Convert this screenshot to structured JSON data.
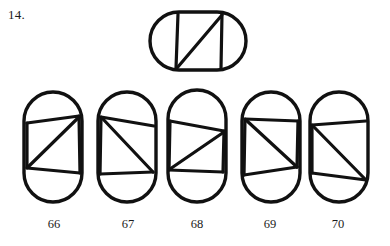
{
  "page": {
    "background_color": "#ffffff",
    "ink_color": "#111111",
    "item_number": "14."
  },
  "prompt": {
    "name": "target-figure",
    "orientation": "horizontal",
    "shape": "stadium",
    "description": "Horizontal stadium containing two vertical chords and one diagonal chord rising left-to-right"
  },
  "options": [
    {
      "label": "66",
      "orientation": "vertical",
      "shape": "stadium",
      "description": "Vertical stadium with upper chord, lower chord, right vertical chord, short left vertical chord and a diagonal falling from upper right to lower left"
    },
    {
      "label": "67",
      "orientation": "vertical",
      "shape": "stadium",
      "description": "Vertical stadium with upper chord, lower chord, left vertical chord and a diagonal falling from upper left to lower right"
    },
    {
      "label": "68",
      "orientation": "vertical",
      "shape": "stadium",
      "description": "Vertical stadium with upper chord, lower chord, both left and right vertical chords and a diagonal falling from upper right to lower left"
    },
    {
      "label": "69",
      "orientation": "vertical",
      "shape": "stadium",
      "description": "Vertical stadium with upper chord, lower chord, left vertical chord, right vertical chord and a diagonal falling from upper left to lower right"
    },
    {
      "label": "70",
      "orientation": "vertical",
      "shape": "stadium",
      "description": "Vertical stadium with upper chord, lower chord, left vertical chord and a diagonal falling from upper left to lower right meeting the lower right corner"
    }
  ],
  "chart_data": {
    "type": "diagram",
    "figures": [
      {
        "id": "prompt",
        "role": "target",
        "label": "",
        "outline": {
          "kind": "stadium",
          "x": 150,
          "y": 12,
          "width": 96,
          "height": 58,
          "rx": 29
        },
        "chords": [
          {
            "name": "left-vertical",
            "x1": 178,
            "y1": 14,
            "x2": 176,
            "y2": 68
          },
          {
            "name": "right-vertical",
            "x1": 222,
            "y1": 14,
            "x2": 221,
            "y2": 68
          },
          {
            "name": "diagonal",
            "x1": 177,
            "y1": 68,
            "x2": 222,
            "y2": 15
          }
        ]
      },
      {
        "id": "option-66",
        "role": "option",
        "label": "66",
        "outline": {
          "kind": "stadium",
          "x": 24,
          "y": 92,
          "width": 58,
          "height": 110,
          "rx": 29
        },
        "chords": [
          {
            "name": "upper-chord",
            "x1": 27,
            "y1": 123,
            "x2": 79,
            "y2": 116
          },
          {
            "name": "lower-chord",
            "x1": 27,
            "y1": 168,
            "x2": 80,
            "y2": 173
          },
          {
            "name": "right-vertical",
            "x1": 79,
            "y1": 116,
            "x2": 80,
            "y2": 173
          },
          {
            "name": "left-vertical",
            "x1": 27,
            "y1": 123,
            "x2": 27,
            "y2": 168
          },
          {
            "name": "diagonal",
            "x1": 79,
            "y1": 117,
            "x2": 28,
            "y2": 167
          }
        ]
      },
      {
        "id": "option-67",
        "role": "option",
        "label": "67",
        "outline": {
          "kind": "stadium",
          "x": 98,
          "y": 92,
          "width": 58,
          "height": 110,
          "rx": 29
        },
        "chords": [
          {
            "name": "upper-chord",
            "x1": 101,
            "y1": 117,
            "x2": 154,
            "y2": 126
          },
          {
            "name": "lower-chord",
            "x1": 100,
            "y1": 174,
            "x2": 153,
            "y2": 172
          },
          {
            "name": "left-vertical",
            "x1": 101,
            "y1": 117,
            "x2": 100,
            "y2": 174
          },
          {
            "name": "diagonal",
            "x1": 102,
            "y1": 118,
            "x2": 153,
            "y2": 172
          }
        ]
      },
      {
        "id": "option-68",
        "role": "option",
        "label": "68",
        "outline": {
          "kind": "stadium",
          "x": 168,
          "y": 90,
          "width": 58,
          "height": 112,
          "rx": 29
        },
        "chords": [
          {
            "name": "upper-chord",
            "x1": 170,
            "y1": 121,
            "x2": 224,
            "y2": 131
          },
          {
            "name": "lower-chord",
            "x1": 169,
            "y1": 170,
            "x2": 223,
            "y2": 172
          },
          {
            "name": "left-vertical",
            "x1": 170,
            "y1": 121,
            "x2": 169,
            "y2": 170
          },
          {
            "name": "right-vertical",
            "x1": 224,
            "y1": 131,
            "x2": 223,
            "y2": 172
          },
          {
            "name": "diagonal",
            "x1": 224,
            "y1": 132,
            "x2": 170,
            "y2": 169
          }
        ]
      },
      {
        "id": "option-69",
        "role": "option",
        "label": "69",
        "outline": {
          "kind": "stadium",
          "x": 242,
          "y": 92,
          "width": 58,
          "height": 110,
          "rx": 29
        },
        "chords": [
          {
            "name": "upper-chord",
            "x1": 245,
            "y1": 119,
            "x2": 298,
            "y2": 121
          },
          {
            "name": "lower-chord",
            "x1": 244,
            "y1": 175,
            "x2": 297,
            "y2": 167
          },
          {
            "name": "left-vertical",
            "x1": 245,
            "y1": 119,
            "x2": 244,
            "y2": 175
          },
          {
            "name": "right-vertical",
            "x1": 298,
            "y1": 121,
            "x2": 297,
            "y2": 167
          },
          {
            "name": "diagonal",
            "x1": 246,
            "y1": 120,
            "x2": 297,
            "y2": 167
          }
        ]
      },
      {
        "id": "option-70",
        "role": "option",
        "label": "70",
        "outline": {
          "kind": "stadium",
          "x": 310,
          "y": 92,
          "width": 58,
          "height": 110,
          "rx": 29
        },
        "chords": [
          {
            "name": "upper-chord",
            "x1": 312,
            "y1": 125,
            "x2": 366,
            "y2": 121
          },
          {
            "name": "lower-chord",
            "x1": 312,
            "y1": 173,
            "x2": 366,
            "y2": 180
          },
          {
            "name": "left-vertical",
            "x1": 312,
            "y1": 125,
            "x2": 312,
            "y2": 173
          },
          {
            "name": "diagonal",
            "x1": 313,
            "y1": 126,
            "x2": 366,
            "y2": 180
          }
        ]
      }
    ]
  }
}
